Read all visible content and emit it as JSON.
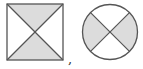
{
  "figures": [
    {
      "shape": "square",
      "divided_by": "two diagonals",
      "regions": 4,
      "shaded_regions": [
        "top",
        "bottom"
      ],
      "unshaded_regions": [
        "left",
        "right"
      ]
    },
    {
      "shape": "circle",
      "divided_by": "two perpendicular diameters at 45 degrees",
      "regions": 4,
      "shaded_regions": [
        "left",
        "right"
      ],
      "unshaded_regions": [
        "top",
        "bottom"
      ]
    }
  ],
  "separator": ",",
  "colors": {
    "stroke": "#555555",
    "shade": "#dcdcdc",
    "background": "#ffffff"
  }
}
